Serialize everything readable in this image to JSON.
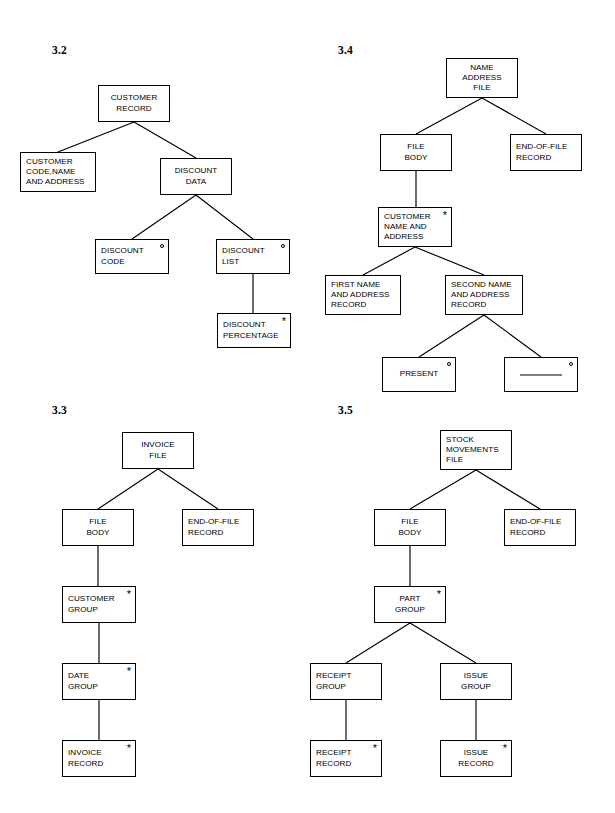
{
  "page": {
    "width": 615,
    "height": 813,
    "background": "#ffffff",
    "ink": "#000000",
    "notation": "Jackson structure diagrams",
    "markers": {
      "iteration": "*",
      "selection": "o"
    }
  },
  "figures": [
    {
      "id": "fig-3-2",
      "number": "3.2",
      "number_pos": {
        "x": 52,
        "y": 44
      },
      "type": "tree",
      "nodes": [
        {
          "id": "n32-root",
          "label": "CUSTOMER\nRECORD",
          "x": 98,
          "y": 85,
          "w": 72,
          "h": 37,
          "align": "center",
          "marker": "none"
        },
        {
          "id": "n32-custcode",
          "label": "CUSTOMER\nCODE,NAME\nAND ADDRESS",
          "x": 20,
          "y": 152,
          "w": 76,
          "h": 40,
          "align": "left",
          "marker": "none"
        },
        {
          "id": "n32-discdata",
          "label": "DISCOUNT\nDATA",
          "x": 160,
          "y": 158,
          "w": 72,
          "h": 37,
          "align": "center",
          "marker": "none"
        },
        {
          "id": "n32-disccode",
          "label": "DISCOUNT\nCODE",
          "x": 95,
          "y": 239,
          "w": 74,
          "h": 35,
          "align": "left",
          "marker": "circle"
        },
        {
          "id": "n32-disclist",
          "label": "DISCOUNT\nLIST",
          "x": 216,
          "y": 239,
          "w": 74,
          "h": 35,
          "align": "left",
          "marker": "circle"
        },
        {
          "id": "n32-discpct",
          "label": "DISCOUNT\nPERCENTAGE",
          "x": 217,
          "y": 313,
          "w": 74,
          "h": 35,
          "align": "left",
          "marker": "star"
        }
      ],
      "edges": [
        {
          "from": "n32-root",
          "to": "n32-custcode",
          "style": "diagonal"
        },
        {
          "from": "n32-root",
          "to": "n32-discdata",
          "style": "diagonal"
        },
        {
          "from": "n32-discdata",
          "to": "n32-disccode",
          "style": "diagonal"
        },
        {
          "from": "n32-discdata",
          "to": "n32-disclist",
          "style": "diagonal"
        },
        {
          "from": "n32-disclist",
          "to": "n32-discpct",
          "style": "vertical"
        }
      ]
    },
    {
      "id": "fig-3-4",
      "number": "3.4",
      "number_pos": {
        "x": 338,
        "y": 44
      },
      "type": "tree",
      "nodes": [
        {
          "id": "n34-root",
          "label": "NAME\nADDRESS\nFILE",
          "x": 446,
          "y": 58,
          "w": 72,
          "h": 40,
          "align": "center",
          "marker": "none"
        },
        {
          "id": "n34-body",
          "label": "FILE\nBODY",
          "x": 380,
          "y": 134,
          "w": 72,
          "h": 37,
          "align": "center",
          "marker": "none"
        },
        {
          "id": "n34-eof",
          "label": "END-OF-FILE\nRECORD",
          "x": 510,
          "y": 134,
          "w": 72,
          "h": 37,
          "align": "left",
          "marker": "none"
        },
        {
          "id": "n34-custname",
          "label": "CUSTOMER\nNAME AND\nADDRESS",
          "x": 378,
          "y": 207,
          "w": 74,
          "h": 40,
          "align": "left",
          "marker": "star"
        },
        {
          "id": "n34-first",
          "label": "FIRST NAME\nAND ADDRESS\nRECORD",
          "x": 325,
          "y": 275,
          "w": 76,
          "h": 40,
          "align": "left",
          "marker": "none"
        },
        {
          "id": "n34-second",
          "label": "SECOND NAME\nAND ADDRESS\nRECORD",
          "x": 445,
          "y": 275,
          "w": 78,
          "h": 40,
          "align": "left",
          "marker": "none"
        },
        {
          "id": "n34-present",
          "label": "PRESENT",
          "x": 382,
          "y": 357,
          "w": 74,
          "h": 35,
          "align": "center",
          "marker": "circle"
        },
        {
          "id": "n34-null",
          "label": "",
          "x": 504,
          "y": 357,
          "w": 74,
          "h": 35,
          "align": "center",
          "marker": "circle",
          "null_rule": true
        }
      ],
      "edges": [
        {
          "from": "n34-root",
          "to": "n34-body",
          "style": "diagonal"
        },
        {
          "from": "n34-root",
          "to": "n34-eof",
          "style": "diagonal"
        },
        {
          "from": "n34-body",
          "to": "n34-custname",
          "style": "vertical"
        },
        {
          "from": "n34-custname",
          "to": "n34-first",
          "style": "diagonal"
        },
        {
          "from": "n34-custname",
          "to": "n34-second",
          "style": "diagonal"
        },
        {
          "from": "n34-second",
          "to": "n34-present",
          "style": "diagonal"
        },
        {
          "from": "n34-second",
          "to": "n34-null",
          "style": "diagonal"
        }
      ]
    },
    {
      "id": "fig-3-3",
      "number": "3.3",
      "number_pos": {
        "x": 52,
        "y": 404
      },
      "type": "tree",
      "nodes": [
        {
          "id": "n33-root",
          "label": "INVOICE\nFILE",
          "x": 122,
          "y": 432,
          "w": 72,
          "h": 37,
          "align": "center",
          "marker": "none"
        },
        {
          "id": "n33-body",
          "label": "FILE\nBODY",
          "x": 62,
          "y": 509,
          "w": 72,
          "h": 37,
          "align": "center",
          "marker": "none"
        },
        {
          "id": "n33-eof",
          "label": "END-OF-FILE\nRECORD",
          "x": 182,
          "y": 509,
          "w": 72,
          "h": 37,
          "align": "left",
          "marker": "none"
        },
        {
          "id": "n33-cust",
          "label": "CUSTOMER\nGROUP",
          "x": 62,
          "y": 586,
          "w": 74,
          "h": 37,
          "align": "left",
          "marker": "star"
        },
        {
          "id": "n33-date",
          "label": "DATE\nGROUP",
          "x": 62,
          "y": 663,
          "w": 74,
          "h": 37,
          "align": "left",
          "marker": "star"
        },
        {
          "id": "n33-inv",
          "label": "INVOICE\nRECORD",
          "x": 62,
          "y": 740,
          "w": 74,
          "h": 37,
          "align": "left",
          "marker": "star"
        }
      ],
      "edges": [
        {
          "from": "n33-root",
          "to": "n33-body",
          "style": "diagonal"
        },
        {
          "from": "n33-root",
          "to": "n33-eof",
          "style": "diagonal"
        },
        {
          "from": "n33-body",
          "to": "n33-cust",
          "style": "vertical"
        },
        {
          "from": "n33-cust",
          "to": "n33-date",
          "style": "vertical"
        },
        {
          "from": "n33-date",
          "to": "n33-inv",
          "style": "vertical"
        }
      ]
    },
    {
      "id": "fig-3-5",
      "number": "3.5",
      "number_pos": {
        "x": 338,
        "y": 404
      },
      "type": "tree",
      "nodes": [
        {
          "id": "n35-root",
          "label": "STOCK\nMOVEMENTS\nFILE",
          "x": 440,
          "y": 430,
          "w": 72,
          "h": 40,
          "align": "left",
          "marker": "none"
        },
        {
          "id": "n35-body",
          "label": "FILE\nBODY",
          "x": 374,
          "y": 509,
          "w": 72,
          "h": 37,
          "align": "center",
          "marker": "none"
        },
        {
          "id": "n35-eof",
          "label": "END-OF-FILE\nRECORD",
          "x": 504,
          "y": 509,
          "w": 72,
          "h": 37,
          "align": "left",
          "marker": "none"
        },
        {
          "id": "n35-part",
          "label": "PART\nGROUP",
          "x": 374,
          "y": 586,
          "w": 72,
          "h": 37,
          "align": "center",
          "marker": "star"
        },
        {
          "id": "n35-receipt",
          "label": "RECEIPT\nGROUP",
          "x": 310,
          "y": 663,
          "w": 72,
          "h": 37,
          "align": "left",
          "marker": "none"
        },
        {
          "id": "n35-issue",
          "label": "ISSUE\nGROUP",
          "x": 440,
          "y": 663,
          "w": 72,
          "h": 37,
          "align": "center",
          "marker": "none"
        },
        {
          "id": "n35-recrec",
          "label": "RECEIPT\nRECORD",
          "x": 310,
          "y": 740,
          "w": 72,
          "h": 37,
          "align": "left",
          "marker": "star"
        },
        {
          "id": "n35-issrec",
          "label": "ISSUE\nRECORD",
          "x": 440,
          "y": 740,
          "w": 72,
          "h": 37,
          "align": "center",
          "marker": "star"
        }
      ],
      "edges": [
        {
          "from": "n35-root",
          "to": "n35-body",
          "style": "diagonal"
        },
        {
          "from": "n35-root",
          "to": "n35-eof",
          "style": "diagonal"
        },
        {
          "from": "n35-body",
          "to": "n35-part",
          "style": "vertical"
        },
        {
          "from": "n35-part",
          "to": "n35-receipt",
          "style": "diagonal"
        },
        {
          "from": "n35-part",
          "to": "n35-issue",
          "style": "diagonal"
        },
        {
          "from": "n35-receipt",
          "to": "n35-recrec",
          "style": "vertical"
        },
        {
          "from": "n35-issue",
          "to": "n35-issrec",
          "style": "vertical"
        }
      ]
    }
  ]
}
